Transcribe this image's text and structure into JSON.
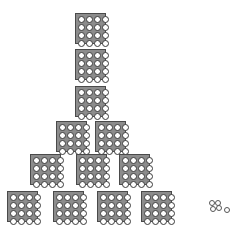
{
  "diagram": {
    "block_grid": "4x4",
    "colors": {
      "block_fill": "#8c8c8c",
      "block_border": "#4a4a4a",
      "dot_fill": "#ffffff",
      "dot_border": "#3a3a3a"
    },
    "blocks": [
      {
        "x": 75,
        "y": 13
      },
      {
        "x": 75,
        "y": 49
      },
      {
        "x": 75,
        "y": 86
      },
      {
        "x": 56,
        "y": 121
      },
      {
        "x": 95,
        "y": 121
      },
      {
        "x": 30,
        "y": 154
      },
      {
        "x": 76,
        "y": 154
      },
      {
        "x": 119,
        "y": 154
      },
      {
        "x": 7,
        "y": 191
      },
      {
        "x": 53,
        "y": 191
      },
      {
        "x": 97,
        "y": 191
      },
      {
        "x": 141,
        "y": 191
      }
    ],
    "units": [
      {
        "x": 209,
        "y": 200
      },
      {
        "x": 215,
        "y": 200
      },
      {
        "x": 210,
        "y": 206
      },
      {
        "x": 216,
        "y": 205
      },
      {
        "x": 224,
        "y": 207
      }
    ]
  }
}
